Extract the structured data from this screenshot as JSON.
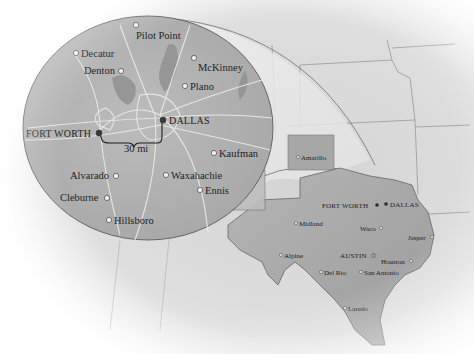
{
  "map": {
    "title": "Dallas–Fort Worth area inset with Texas locator map",
    "colors": {
      "background": "#ffffff",
      "land_light": "#e4e4e4",
      "land_mid": "#cfcfcf",
      "texas": "#a9a9a9",
      "inset": "#b4b4b4",
      "roads": "#ececec",
      "text": "#1e1e1e",
      "major_city_dot": "#3a3a3a"
    },
    "inset": {
      "scale_label": "30 mi",
      "major_cities": [
        {
          "name": "FORT WORTH"
        },
        {
          "name": "DALLAS"
        }
      ],
      "cities": [
        {
          "name": "Pilot Point"
        },
        {
          "name": "Decatur"
        },
        {
          "name": "Denton"
        },
        {
          "name": "McKinney"
        },
        {
          "name": "Plano"
        },
        {
          "name": "Kaufman"
        },
        {
          "name": "Alvarado"
        },
        {
          "name": "Waxahachie"
        },
        {
          "name": "Ennis"
        },
        {
          "name": "Cleburne"
        },
        {
          "name": "Hillsboro"
        }
      ]
    },
    "texas": {
      "capital": "AUSTIN",
      "major_cities": [
        {
          "name": "FORT WORTH"
        },
        {
          "name": "DALLAS"
        }
      ],
      "cities": [
        {
          "name": "Amarillo"
        },
        {
          "name": "Midland"
        },
        {
          "name": "Waco"
        },
        {
          "name": "Jasper"
        },
        {
          "name": "Alpine"
        },
        {
          "name": "Houston"
        },
        {
          "name": "Del Rio"
        },
        {
          "name": "San Antonio"
        },
        {
          "name": "Laredo"
        }
      ]
    }
  }
}
